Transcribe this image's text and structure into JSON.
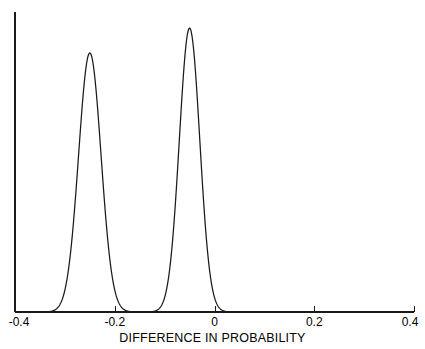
{
  "chart_data": {
    "type": "line",
    "title": "",
    "subtitle": "",
    "xlabel": "DIFFERENCE IN PROBABILITY",
    "ylabel": "",
    "xlim": [
      -0.4,
      0.4
    ],
    "ylim": [
      0,
      20.5
    ],
    "xticks": [
      -0.4,
      -0.2,
      0,
      0.2,
      0.4
    ],
    "xtick_labels": [
      "-0.4",
      "-0.2",
      "0",
      "0.2",
      "0.4"
    ],
    "yticks": [],
    "ytick_labels": [],
    "grid": false,
    "legend": null,
    "annotations": [],
    "line_color": "#1a1a1a",
    "axis_color": "#1a1a1a",
    "background": "#ffffff",
    "series": [
      {
        "name": "distribution-left",
        "kind": "gaussian-density",
        "mean": -0.25,
        "sigma": 0.0225,
        "peak_height": 17.7,
        "peak_x": -0.25
      },
      {
        "name": "distribution-right",
        "kind": "gaussian-density",
        "mean": -0.05,
        "sigma": 0.0205,
        "peak_height": 19.4,
        "peak_x": -0.05
      }
    ]
  },
  "axis": {
    "x_title": "DIFFERENCE IN PROBABILITY",
    "tick_labels": [
      "-0.4",
      "-0.2",
      "0",
      "0.2",
      "0.4"
    ]
  }
}
